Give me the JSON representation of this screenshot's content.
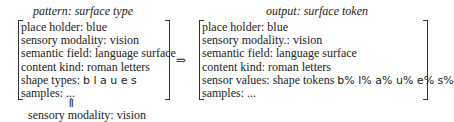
{
  "pattern": {
    "title": "pattern: surface type",
    "lines": [
      {
        "key": "place holder:",
        "value": "blue"
      },
      {
        "key": "sensory modality:",
        "value": "vision"
      },
      {
        "key": "semantic field:",
        "value": "language surface"
      },
      {
        "key": "content kind:",
        "value": "roman letters"
      },
      {
        "key": "shape types:",
        "value": "b l a u e s"
      },
      {
        "key": "samples:",
        "value": "..."
      }
    ]
  },
  "transform_arrow": "⇒",
  "up_arrow": "⇑",
  "input_caption": "sensory modality: vision",
  "output": {
    "title": "output: surface token",
    "lines": [
      {
        "key": "place holder:",
        "value": "blue"
      },
      {
        "key": "sensory modality.:",
        "value": "vision"
      },
      {
        "key": "semantic field:",
        "value": "language surface"
      },
      {
        "key": "content kind:",
        "value": "roman letters"
      },
      {
        "key": "sensor values:",
        "value": "shape tokens",
        "extra": "b% l% a% u% e% s%"
      },
      {
        "key": "samples:",
        "value": "..."
      }
    ]
  }
}
